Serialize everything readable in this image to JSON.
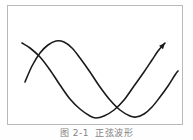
{
  "figure": {
    "caption_label": "图 2-1",
    "caption_text": "正弦波形",
    "frame_color": "#b9b9b9",
    "curve_color": "#1a1a1a",
    "background_color": "#ffffff"
  },
  "chart_data": {
    "type": "line",
    "xlabel": "",
    "ylabel": "",
    "grid": false,
    "legend": "none",
    "axis_visible": false,
    "xlim": [
      0,
      176
    ],
    "ylim": [
      0,
      120
    ],
    "annotations": [
      {
        "name": "arrow-endpoint",
        "shape": "arrowhead",
        "x": 165,
        "y": 43
      }
    ],
    "series": [
      {
        "name": "wave-1",
        "color": "#1a1a1a",
        "width": 1.6,
        "marker_end": "arrow",
        "points": [
          [
            22,
            43
          ],
          [
            30,
            48
          ],
          [
            40,
            57
          ],
          [
            50,
            70
          ],
          [
            60,
            85
          ],
          [
            70,
            99
          ],
          [
            80,
            109
          ],
          [
            90,
            116
          ],
          [
            96,
            118
          ],
          [
            104,
            116
          ],
          [
            114,
            110
          ],
          [
            124,
            100
          ],
          [
            134,
            86
          ],
          [
            144,
            72
          ],
          [
            152,
            60
          ],
          [
            158,
            51
          ],
          [
            163,
            45
          ],
          [
            165,
            43
          ]
        ]
      },
      {
        "name": "wave-2",
        "color": "#1a1a1a",
        "width": 1.6,
        "marker_end": "none",
        "points": [
          [
            25,
            82
          ],
          [
            32,
            66
          ],
          [
            40,
            53
          ],
          [
            48,
            45
          ],
          [
            56,
            41
          ],
          [
            64,
            42
          ],
          [
            72,
            48
          ],
          [
            80,
            58
          ],
          [
            90,
            72
          ],
          [
            100,
            87
          ],
          [
            110,
            100
          ],
          [
            120,
            110
          ],
          [
            130,
            116
          ],
          [
            136,
            117
          ],
          [
            144,
            114
          ],
          [
            152,
            107
          ],
          [
            160,
            97
          ],
          [
            168,
            86
          ],
          [
            175,
            75
          ],
          [
            178,
            71
          ]
        ]
      }
    ]
  }
}
